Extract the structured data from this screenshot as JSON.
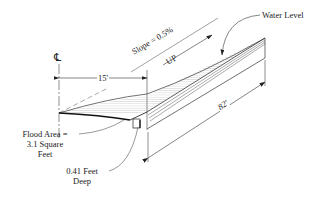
{
  "diagram": {
    "labels": {
      "centerline": "℄",
      "slope": "Slope = 0.5%",
      "up": "UP",
      "water_level": "Water Level",
      "width": "15'",
      "length": "82'",
      "flood_area_line1": "Flood Area =",
      "flood_area_line2": "3.1 Square",
      "flood_area_line3": "Feet",
      "depth_line1": "0.41 Feet",
      "depth_line2": "Deep"
    },
    "values": {
      "slope_percent": 0.5,
      "spread_ft": 15,
      "length_ft": 82,
      "flood_area_sqft": 3.1,
      "depth_ft": 0.41
    },
    "colors": {
      "line": "#222222",
      "hatch": "#8a8a8a",
      "background": "#ffffff"
    }
  }
}
